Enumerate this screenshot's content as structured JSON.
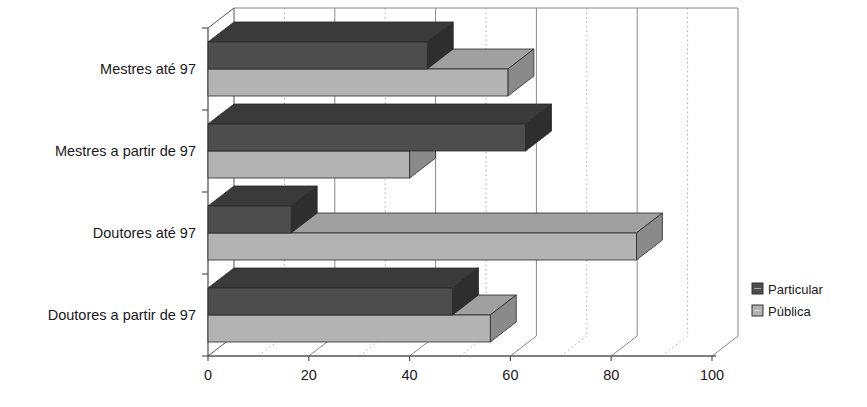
{
  "chart_data": {
    "type": "bar",
    "orientation": "horizontal",
    "style": "3d",
    "title": "",
    "subtitle": "",
    "xlabel": "",
    "ylabel": "",
    "categories": [
      "Mestres até  97",
      "Mestres a partir de 97",
      "Doutores até  97",
      "Doutores a partir de 97"
    ],
    "series": [
      {
        "name": "Particular",
        "color": "#4d4d4d",
        "values": [
          43.5,
          63,
          16.5,
          48.5
        ]
      },
      {
        "name": "Pública",
        "color": "#b3b3b3",
        "values": [
          59.5,
          40,
          85,
          56
        ]
      }
    ],
    "xlim": [
      0,
      100
    ],
    "xticks": [
      0,
      20,
      40,
      60,
      80,
      100
    ],
    "xtick_labels": [
      "0",
      "20",
      "40",
      "60",
      "80",
      "100"
    ],
    "minor_gridlines": [
      10,
      30,
      50,
      70,
      90
    ],
    "grid": true,
    "grid_major_style": "solid",
    "grid_minor_style": "dotted",
    "legend": {
      "position": "right",
      "entries": [
        {
          "label": "Particular",
          "color": "#4d4d4d"
        },
        {
          "label": "Pública",
          "color": "#b3b3b3"
        }
      ]
    }
  },
  "axis": {
    "tick_0": "0",
    "tick_20": "20",
    "tick_40": "40",
    "tick_60": "60",
    "tick_80": "80",
    "tick_100": "100"
  },
  "labels": {
    "cat_0": "Mestres até  97",
    "cat_1": "Mestres a partir de 97",
    "cat_2": "Doutores até  97",
    "cat_3": "Doutores a partir de 97"
  },
  "legend": {
    "particular": "Particular",
    "publica": "Pública"
  },
  "colors": {
    "particular_front": "#4d4d4d",
    "particular_top": "#3a3a3a",
    "particular_side": "#2e2e2e",
    "publica_front": "#b3b3b3",
    "publica_top": "#a0a0a0",
    "publica_side": "#8a8a8a",
    "axis": "#555555",
    "grid_major": "#888888",
    "grid_minor": "#aaaaaa"
  }
}
